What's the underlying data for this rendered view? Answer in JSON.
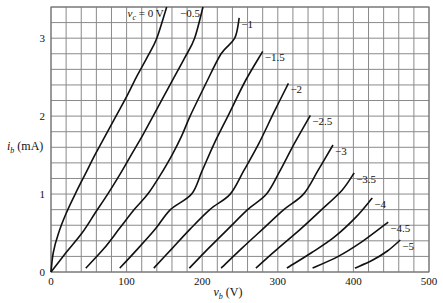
{
  "chart_data": {
    "type": "line",
    "title": "",
    "xlabel": "v_b (V)",
    "ylabel": "i_b (mA)",
    "xlim": [
      0,
      500
    ],
    "ylim": [
      0,
      3.4
    ],
    "grid": true,
    "x_grid_step": 20,
    "y_grid_step": 0.2,
    "x_ticks": [
      0,
      100,
      200,
      300,
      400,
      500
    ],
    "y_ticks": [
      0,
      1,
      2,
      3
    ],
    "legend_position": "inline labels at curve ends",
    "series": [
      {
        "name": "v_c = 0 V",
        "label": "v_c = 0 V",
        "points": [
          [
            0,
            0
          ],
          [
            3,
            0.25
          ],
          [
            10,
            0.5
          ],
          [
            20,
            0.75
          ],
          [
            32,
            1.0
          ],
          [
            45,
            1.25
          ],
          [
            58,
            1.5
          ],
          [
            72,
            1.75
          ],
          [
            86,
            2.0
          ],
          [
            100,
            2.25
          ],
          [
            113,
            2.5
          ],
          [
            127,
            2.75
          ],
          [
            140,
            3.0
          ],
          [
            153,
            3.4
          ]
        ]
      },
      {
        "name": "-0.5",
        "label": "−0.5",
        "points": [
          [
            0,
            0
          ],
          [
            20,
            0.25
          ],
          [
            41,
            0.5
          ],
          [
            58,
            0.75
          ],
          [
            75,
            1.0
          ],
          [
            91,
            1.25
          ],
          [
            106,
            1.5
          ],
          [
            121,
            1.75
          ],
          [
            135,
            2.0
          ],
          [
            149,
            2.25
          ],
          [
            163,
            2.5
          ],
          [
            177,
            2.75
          ],
          [
            190,
            3.0
          ],
          [
            201,
            3.4
          ]
        ]
      },
      {
        "name": "-1",
        "label": "−1",
        "points": [
          [
            46,
            0.05
          ],
          [
            70,
            0.3
          ],
          [
            90,
            0.55
          ],
          [
            110,
            0.8
          ],
          [
            128,
            1.0
          ],
          [
            145,
            1.25
          ],
          [
            160,
            1.5
          ],
          [
            173,
            1.75
          ],
          [
            184,
            2.0
          ],
          [
            204,
            2.4
          ],
          [
            225,
            2.8
          ],
          [
            243,
            3.0
          ],
          [
            249,
            3.26
          ]
        ]
      },
      {
        "name": "-1.5",
        "label": "−1.5",
        "points": [
          [
            91,
            0.05
          ],
          [
            115,
            0.3
          ],
          [
            138,
            0.55
          ],
          [
            158,
            0.8
          ],
          [
            186,
            1.0
          ],
          [
            200,
            1.3
          ],
          [
            216,
            1.65
          ],
          [
            234,
            2.0
          ],
          [
            257,
            2.45
          ],
          [
            280,
            2.83
          ]
        ]
      },
      {
        "name": "-2",
        "label": "−2",
        "points": [
          [
            136,
            0.05
          ],
          [
            160,
            0.3
          ],
          [
            184,
            0.55
          ],
          [
            210,
            0.8
          ],
          [
            237,
            1.0
          ],
          [
            255,
            1.3
          ],
          [
            275,
            1.65
          ],
          [
            295,
            2.05
          ],
          [
            314,
            2.42
          ]
        ]
      },
      {
        "name": "-2.5",
        "label": "−2.5",
        "points": [
          [
            183,
            0.05
          ],
          [
            208,
            0.3
          ],
          [
            234,
            0.55
          ],
          [
            260,
            0.8
          ],
          [
            285,
            1.0
          ],
          [
            303,
            1.3
          ],
          [
            322,
            1.65
          ],
          [
            343,
            2.01
          ]
        ]
      },
      {
        "name": "-3",
        "label": "−3",
        "points": [
          [
            225,
            0.05
          ],
          [
            252,
            0.3
          ],
          [
            280,
            0.55
          ],
          [
            308,
            0.8
          ],
          [
            334,
            1.0
          ],
          [
            353,
            1.3
          ],
          [
            373,
            1.63
          ]
        ]
      },
      {
        "name": "-3.5",
        "label": "−3.5",
        "points": [
          [
            271,
            0.05
          ],
          [
            300,
            0.3
          ],
          [
            330,
            0.55
          ],
          [
            358,
            0.8
          ],
          [
            385,
            1.05
          ],
          [
            401,
            1.27
          ]
        ]
      },
      {
        "name": "-4",
        "label": "−4",
        "points": [
          [
            312,
            0.05
          ],
          [
            345,
            0.25
          ],
          [
            375,
            0.45
          ],
          [
            403,
            0.7
          ],
          [
            425,
            0.95
          ]
        ]
      },
      {
        "name": "-4.5",
        "label": "−4.5",
        "points": [
          [
            346,
            0.05
          ],
          [
            380,
            0.2
          ],
          [
            410,
            0.38
          ],
          [
            446,
            0.64
          ]
        ]
      },
      {
        "name": "-5",
        "label": "−5",
        "points": [
          [
            402,
            0.05
          ],
          [
            425,
            0.15
          ],
          [
            445,
            0.27
          ],
          [
            462,
            0.41
          ]
        ]
      }
    ]
  },
  "labels": {
    "xlabel": "v_b (V)",
    "ylabel": "i_b (mA)",
    "x_ticks": [
      "0",
      "100",
      "200",
      "300",
      "400",
      "500"
    ],
    "y_ticks": [
      "0",
      "1",
      "2",
      "3"
    ]
  }
}
